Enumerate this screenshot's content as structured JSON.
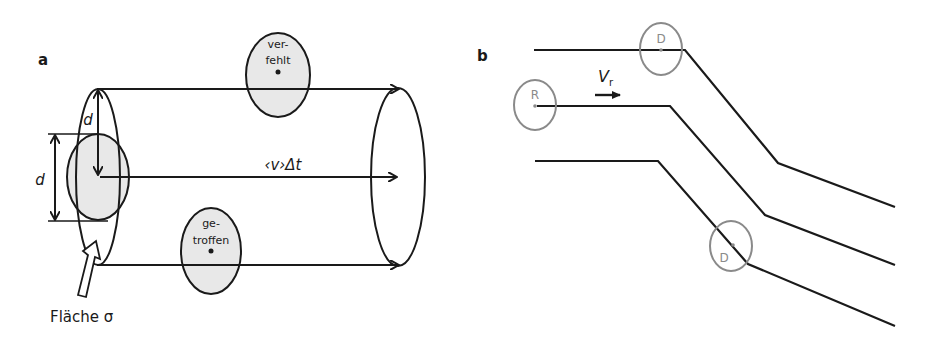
{
  "panel_a": {
    "label": "a",
    "missed_label_line1": "ver-",
    "missed_label_line2": "fehlt",
    "hit_label_line1": "ge-",
    "hit_label_line2": "troffen",
    "distance_label": "‹v›Δt",
    "diameter_label_outer": "d",
    "diameter_label_inner": "d",
    "area_label": "Fläche σ"
  },
  "panel_b": {
    "label": "b",
    "velocity_symbol": "V",
    "velocity_subscript": "r",
    "circle_top_label": "D",
    "circle_reference_label": "R",
    "circle_bottom_label": "D"
  },
  "colors": {
    "line": "#1a1a1a",
    "shade": "#e8e8e8",
    "circle_grey": "#8a8a8a"
  }
}
